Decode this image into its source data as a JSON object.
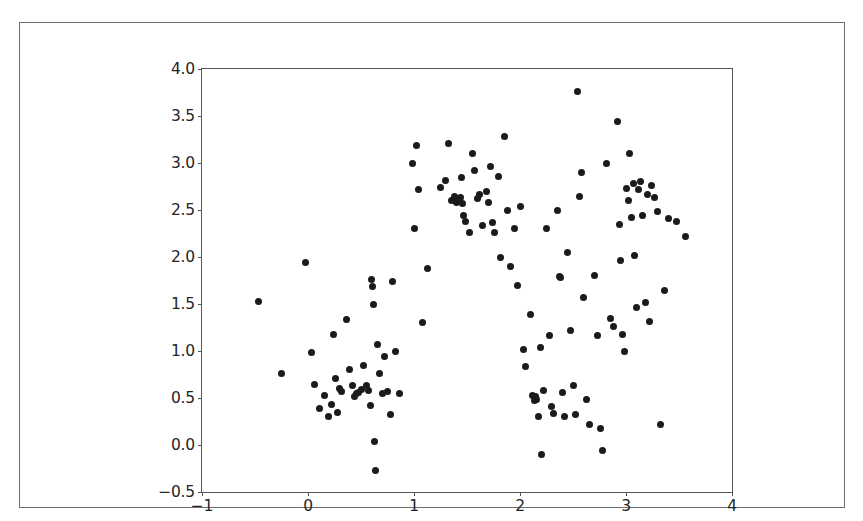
{
  "figure": {
    "background_color": "#ffffff",
    "frame_color": "#6e6e6e",
    "axes_color": "#555555",
    "marker_color": "#1b1b1b"
  },
  "chart_data": {
    "type": "scatter",
    "title": "",
    "xlabel": "",
    "ylabel": "",
    "xlim": [
      -1,
      4
    ],
    "ylim": [
      -0.5,
      4.0
    ],
    "xticks": [
      -1,
      0,
      1,
      2,
      3,
      4
    ],
    "yticks": [
      -0.5,
      0.0,
      0.5,
      1.0,
      1.5,
      2.0,
      2.5,
      3.0,
      3.5,
      4.0
    ],
    "xticklabels": [
      "−1",
      "0",
      "1",
      "2",
      "3",
      "4"
    ],
    "yticklabels": [
      "−0.5",
      "0.0",
      "0.5",
      "1.0",
      "1.5",
      "2.0",
      "2.5",
      "3.0",
      "3.5",
      "4.0"
    ],
    "grid": false,
    "legend": null,
    "marker": "circle",
    "marker_size": 7,
    "marker_color": "#1b1b1b",
    "n_points": 139,
    "series": [
      {
        "name": "points",
        "points": [
          [
            -0.47,
            1.53
          ],
          [
            -0.25,
            0.76
          ],
          [
            -0.02,
            1.94
          ],
          [
            0.03,
            0.98
          ],
          [
            0.06,
            0.64
          ],
          [
            0.11,
            0.39
          ],
          [
            0.16,
            0.53
          ],
          [
            0.19,
            0.3
          ],
          [
            0.22,
            0.43
          ],
          [
            0.24,
            1.18
          ],
          [
            0.26,
            0.71
          ],
          [
            0.28,
            0.35
          ],
          [
            0.3,
            0.6
          ],
          [
            0.32,
            0.57
          ],
          [
            0.36,
            1.34
          ],
          [
            0.39,
            0.8
          ],
          [
            0.42,
            0.63
          ],
          [
            0.44,
            0.52
          ],
          [
            0.46,
            0.55
          ],
          [
            0.48,
            0.56
          ],
          [
            0.5,
            0.59
          ],
          [
            0.52,
            0.85
          ],
          [
            0.55,
            0.63
          ],
          [
            0.57,
            0.58
          ],
          [
            0.59,
            0.42
          ],
          [
            0.6,
            1.76
          ],
          [
            0.61,
            1.69
          ],
          [
            0.62,
            1.5
          ],
          [
            0.63,
            0.04
          ],
          [
            0.64,
            -0.27
          ],
          [
            0.66,
            1.07
          ],
          [
            0.67,
            0.76
          ],
          [
            0.7,
            0.55
          ],
          [
            0.72,
            0.94
          ],
          [
            0.75,
            0.57
          ],
          [
            0.78,
            0.32
          ],
          [
            0.8,
            1.74
          ],
          [
            0.83,
            1.0
          ],
          [
            0.86,
            0.55
          ],
          [
            0.99,
            2.99
          ],
          [
            1.0,
            2.3
          ],
          [
            1.02,
            3.19
          ],
          [
            1.04,
            2.72
          ],
          [
            1.08,
            1.3
          ],
          [
            1.13,
            1.88
          ],
          [
            1.25,
            2.74
          ],
          [
            1.3,
            2.81
          ],
          [
            1.33,
            3.21
          ],
          [
            1.35,
            2.6
          ],
          [
            1.38,
            2.64
          ],
          [
            1.4,
            2.58
          ],
          [
            1.43,
            2.61
          ],
          [
            1.45,
            2.85
          ],
          [
            1.47,
            2.44
          ],
          [
            1.49,
            2.38
          ],
          [
            1.52,
            2.26
          ],
          [
            1.55,
            3.1
          ],
          [
            1.57,
            2.92
          ],
          [
            1.6,
            2.62
          ],
          [
            1.62,
            2.66
          ],
          [
            1.65,
            2.33
          ],
          [
            1.68,
            2.7
          ],
          [
            1.7,
            2.58
          ],
          [
            1.72,
            2.96
          ],
          [
            1.74,
            2.37
          ],
          [
            1.76,
            2.26
          ],
          [
            1.8,
            2.86
          ],
          [
            1.82,
            1.99
          ],
          [
            1.85,
            3.28
          ],
          [
            1.88,
            2.49
          ],
          [
            1.91,
            1.9
          ],
          [
            1.95,
            2.3
          ],
          [
            1.98,
            1.7
          ],
          [
            2.0,
            2.54
          ],
          [
            2.03,
            1.02
          ],
          [
            2.05,
            0.84
          ],
          [
            2.1,
            1.39
          ],
          [
            2.12,
            0.53
          ],
          [
            2.14,
            0.47
          ],
          [
            2.16,
            0.48
          ],
          [
            2.17,
            0.3
          ],
          [
            2.19,
            1.04
          ],
          [
            2.2,
            -0.1
          ],
          [
            2.22,
            0.58
          ],
          [
            2.25,
            2.3
          ],
          [
            2.28,
            1.16
          ],
          [
            2.3,
            0.41
          ],
          [
            2.32,
            0.34
          ],
          [
            2.35,
            2.5
          ],
          [
            2.37,
            1.79
          ],
          [
            2.38,
            1.78
          ],
          [
            2.4,
            0.56
          ],
          [
            2.42,
            0.3
          ],
          [
            2.45,
            2.05
          ],
          [
            2.48,
            1.22
          ],
          [
            2.5,
            0.63
          ],
          [
            2.52,
            0.32
          ],
          [
            2.54,
            3.76
          ],
          [
            2.56,
            2.64
          ],
          [
            2.58,
            2.9
          ],
          [
            2.6,
            1.57
          ],
          [
            2.63,
            0.48
          ],
          [
            2.66,
            0.22
          ],
          [
            2.7,
            1.8
          ],
          [
            2.73,
            1.16
          ],
          [
            2.76,
            0.18
          ],
          [
            2.78,
            -0.06
          ],
          [
            2.82,
            2.99
          ],
          [
            2.85,
            1.35
          ],
          [
            2.88,
            1.26
          ],
          [
            2.92,
            3.44
          ],
          [
            2.94,
            2.35
          ],
          [
            2.95,
            1.96
          ],
          [
            2.97,
            1.18
          ],
          [
            2.99,
            1.0
          ],
          [
            3.0,
            2.73
          ],
          [
            3.02,
            2.6
          ],
          [
            3.03,
            3.1
          ],
          [
            3.05,
            2.42
          ],
          [
            3.07,
            2.78
          ],
          [
            3.08,
            2.02
          ],
          [
            3.1,
            1.46
          ],
          [
            3.12,
            2.72
          ],
          [
            3.14,
            2.8
          ],
          [
            3.16,
            2.44
          ],
          [
            3.18,
            1.52
          ],
          [
            3.2,
            2.66
          ],
          [
            3.22,
            1.31
          ],
          [
            3.24,
            2.76
          ],
          [
            3.27,
            2.63
          ],
          [
            3.3,
            2.48
          ],
          [
            3.33,
            0.22
          ],
          [
            3.36,
            1.64
          ],
          [
            3.4,
            2.41
          ],
          [
            3.48,
            2.38
          ],
          [
            3.56,
            2.22
          ],
          [
            1.44,
            2.63
          ],
          [
            1.46,
            2.57
          ],
          [
            2.15,
            0.52
          ]
        ]
      }
    ]
  }
}
